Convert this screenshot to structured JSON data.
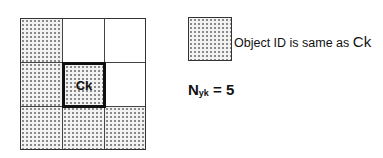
{
  "grid": {
    "rows": 3,
    "cols": 3,
    "cells": [
      {
        "row": 0,
        "col": 0,
        "same_id": true
      },
      {
        "row": 0,
        "col": 1,
        "same_id": false
      },
      {
        "row": 0,
        "col": 2,
        "same_id": false
      },
      {
        "row": 1,
        "col": 0,
        "same_id": true
      },
      {
        "row": 1,
        "col": 1,
        "same_id": true,
        "center": true,
        "label": "Ck"
      },
      {
        "row": 1,
        "col": 2,
        "same_id": false
      },
      {
        "row": 2,
        "col": 0,
        "same_id": true
      },
      {
        "row": 2,
        "col": 1,
        "same_id": true
      },
      {
        "row": 2,
        "col": 2,
        "same_id": true
      }
    ],
    "center_label": "Ck"
  },
  "legend": {
    "text": "Object ID is same as ",
    "symbol": "Ck"
  },
  "count": {
    "label": "N",
    "subscript": "yk",
    "equation": " = 5"
  }
}
